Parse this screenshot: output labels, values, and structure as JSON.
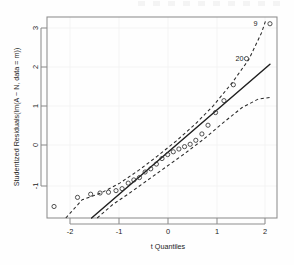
{
  "chart_data": {
    "type": "scatter",
    "title": "",
    "xlabel": "t Quantiles",
    "ylabel": "Studentized Residuals(lm(A ~ N, data = m))",
    "xlim": [
      -2.45,
      2.45
    ],
    "ylim": [
      -1.62,
      3.45
    ],
    "grid": false,
    "legend": null,
    "xticks": [
      -2,
      -1,
      0,
      1,
      2
    ],
    "xtick_labels": [
      "-2",
      "-1",
      "0",
      "1",
      "2"
    ],
    "yticks": [
      -1,
      0,
      1,
      2,
      3
    ],
    "ytick_labels": [
      "-1",
      "0",
      "1",
      "2",
      "3"
    ],
    "series": [
      {
        "name": "studentized residuals",
        "marker": "open-circle",
        "x": [
          -2.3,
          -1.8,
          -1.52,
          -1.32,
          -1.14,
          -0.98,
          -0.85,
          -0.72,
          -0.6,
          -0.48,
          -0.36,
          -0.24,
          -0.12,
          0.0,
          0.12,
          0.24,
          0.36,
          0.48,
          0.6,
          0.72,
          0.85,
          0.98,
          1.14,
          1.32,
          1.52,
          1.8,
          2.3
        ],
        "y": [
          -1.33,
          -1.1,
          -1.02,
          -0.99,
          -0.97,
          -0.93,
          -0.88,
          -0.74,
          -0.66,
          -0.6,
          -0.46,
          -0.38,
          -0.26,
          -0.12,
          -0.02,
          0.05,
          0.12,
          0.18,
          0.24,
          0.34,
          0.5,
          0.72,
          1.04,
          1.34,
          1.74,
          2.4,
          3.28
        ]
      }
    ],
    "reference_line": {
      "style": "solid",
      "x": [
        -1.5,
        2.3
      ],
      "y": [
        -1.62,
        2.26
      ]
    },
    "confidence_band_upper": {
      "style": "dashed",
      "x": [
        -2.05,
        -1.7,
        -1.3,
        -0.9,
        -0.5,
        -0.1,
        0.3,
        0.7,
        1.1,
        1.5,
        1.85,
        2.12,
        2.22
      ],
      "y": [
        -1.62,
        -1.16,
        -0.99,
        -0.74,
        -0.42,
        -0.06,
        0.32,
        0.74,
        1.22,
        1.8,
        2.38,
        3.05,
        3.4
      ]
    },
    "confidence_band_lower": {
      "style": "dashed",
      "x": [
        -1.38,
        -1.05,
        -0.7,
        -0.3,
        0.1,
        0.5,
        0.9,
        1.3,
        1.7,
        2.05,
        2.3
      ],
      "y": [
        -1.62,
        -1.28,
        -1.0,
        -0.66,
        -0.32,
        0.02,
        0.38,
        0.78,
        1.16,
        1.38,
        1.42
      ]
    },
    "annotations": [
      {
        "text": "9",
        "x": 2.12,
        "y": 3.28,
        "position": "left"
      },
      {
        "text": "20",
        "x": 1.82,
        "y": 2.4,
        "position": "left"
      }
    ]
  },
  "axes": {
    "x_title": "t Quantiles",
    "y_title": "Studentized Residuals(lm(A ~ N, data = m))"
  },
  "ticks": {
    "x": [
      "-2",
      "-1",
      "0",
      "1",
      "2"
    ],
    "y": [
      "3",
      "2",
      "1",
      "0",
      "-1"
    ]
  },
  "labels": {
    "outlier_high": "9",
    "outlier_mid": "20"
  },
  "colors": {
    "point_stroke": "#333333",
    "reference_line": "#1f1f1f",
    "band": "#2a2a2a",
    "frame": "#8d8d8d",
    "text": "#1b1b1b",
    "background": "#fefefe"
  }
}
